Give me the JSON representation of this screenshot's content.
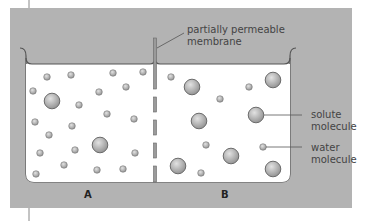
{
  "diagram": {
    "labels": {
      "membrane": [
        "partially permeable",
        "membrane"
      ],
      "solute": [
        "solute",
        "molecule"
      ],
      "water": [
        "water",
        "molecule"
      ],
      "side_a": "A",
      "side_b": "B"
    },
    "colors": {
      "panel": "#b3b3b3",
      "container_fill": "#ffffff",
      "container_stroke": "#555555",
      "membrane": "#9a9a9a",
      "molecule_fill": "#a8a8a8",
      "molecule_stroke": "#6b6b6b",
      "text": "#444444"
    },
    "side_a": {
      "water_molecules": [
        [
          47,
          77
        ],
        [
          71,
          75
        ],
        [
          113,
          73
        ],
        [
          143,
          72
        ],
        [
          33,
          91
        ],
        [
          99,
          92
        ],
        [
          126,
          87
        ],
        [
          79,
          105
        ],
        [
          107,
          114
        ],
        [
          134,
          119
        ],
        [
          35,
          122
        ],
        [
          72,
          126
        ],
        [
          49,
          135
        ],
        [
          40,
          153
        ],
        [
          75,
          150
        ],
        [
          135,
          153
        ],
        [
          64,
          165
        ],
        [
          36,
          174
        ],
        [
          97,
          170
        ],
        [
          123,
          169
        ]
      ],
      "solute_molecules": [
        [
          52,
          101
        ],
        [
          100,
          145
        ]
      ]
    },
    "side_b": {
      "water_molecules": [
        [
          171,
          77
        ],
        [
          249,
          87
        ],
        [
          220,
          99
        ],
        [
          206,
          145
        ],
        [
          263,
          147
        ],
        [
          201,
          173
        ]
      ],
      "solute_molecules": [
        [
          192,
          87
        ],
        [
          273,
          80
        ],
        [
          256,
          115
        ],
        [
          199,
          121
        ],
        [
          231,
          156
        ],
        [
          178,
          166
        ],
        [
          273,
          169
        ]
      ]
    }
  }
}
